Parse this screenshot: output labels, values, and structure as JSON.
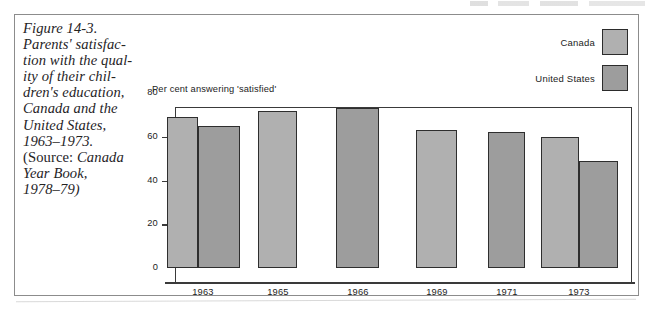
{
  "figure": {
    "caption_lines": [
      "Figure 14-3.",
      "Parents' satisfac-",
      "tion with the qual-",
      "ity of their chil-",
      "dren's education,",
      "Canada and the",
      "United States,",
      "1963–1973.",
      "(Source: Canada",
      "Year Book,",
      "1978–79)"
    ]
  },
  "legend": {
    "position": "top-right",
    "entries": [
      {
        "label": "Canada",
        "color": "#b0b0b0"
      },
      {
        "label": "United States",
        "color": "#9d9d9d"
      }
    ]
  },
  "axis": {
    "ylabel": "Per cent answering 'satisfied'",
    "yticks": [
      "80",
      "60",
      "40",
      "20",
      "0"
    ],
    "xticks": [
      "1963",
      "1965",
      "1966",
      "1969",
      "1971",
      "1973"
    ]
  },
  "chart_data": {
    "type": "bar",
    "source": "Canada Year Book, 1978–79",
    "xlabel": "",
    "ylabel": "Per cent answering 'satisfied'",
    "ylim": [
      0,
      80
    ],
    "ytick_values": [
      0,
      20,
      40,
      60,
      80
    ],
    "grid": false,
    "legend_position": "top-right",
    "categories": [
      "1963",
      "1965",
      "1966",
      "1969",
      "1971",
      "1973"
    ],
    "series": [
      {
        "name": "Canada",
        "color": "#b0b0b0",
        "values": [
          69,
          72,
          73,
          63,
          62,
          60
        ]
      },
      {
        "name": "United States",
        "color": "#9d9d9d",
        "values": [
          65,
          null,
          null,
          null,
          null,
          49
        ]
      }
    ]
  },
  "bars": [
    {
      "name": "bar-1963-canada",
      "series": "Canada",
      "category": "1963",
      "value": 69,
      "left": 166,
      "width": 31,
      "color": "#b0b0b0"
    },
    {
      "name": "bar-1963-united-states",
      "series": "United States",
      "category": "1963",
      "value": 65,
      "left": 197,
      "width": 42,
      "color": "#9d9d9d"
    },
    {
      "name": "bar-1965-canada",
      "series": "Canada",
      "category": "1965",
      "value": 72,
      "left": 257,
      "width": 39,
      "color": "#b0b0b0"
    },
    {
      "name": "bar-1966-canada",
      "series": "Canada",
      "category": "1966",
      "value": 73,
      "left": 335,
      "width": 43,
      "color": "#9d9d9d"
    },
    {
      "name": "bar-1969-canada",
      "series": "Canada",
      "category": "1969",
      "value": 63,
      "left": 415,
      "width": 41,
      "color": "#b0b0b0"
    },
    {
      "name": "bar-1971-canada",
      "series": "Canada",
      "category": "1971",
      "value": 62,
      "left": 487,
      "width": 37,
      "color": "#9d9d9d"
    },
    {
      "name": "bar-1973-canada",
      "series": "Canada",
      "category": "1973",
      "value": 60,
      "left": 540,
      "width": 38,
      "color": "#b0b0b0"
    },
    {
      "name": "bar-1973-united-states",
      "series": "United States",
      "category": "1973",
      "value": 49,
      "left": 578,
      "width": 39,
      "color": "#9d9d9d"
    }
  ],
  "xtick_positions": [
    {
      "label": "1963",
      "center": 202
    },
    {
      "label": "1965",
      "center": 277
    },
    {
      "label": "1966",
      "center": 357
    },
    {
      "label": "1969",
      "center": 436
    },
    {
      "label": "1971",
      "center": 506
    },
    {
      "label": "1973",
      "center": 578
    }
  ]
}
